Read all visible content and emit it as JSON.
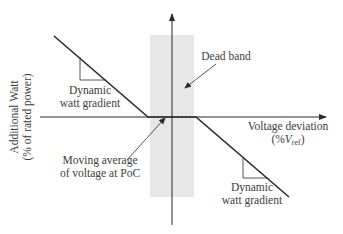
{
  "diagram": {
    "type": "droop-characteristic",
    "y_axis": {
      "line1": "Additional Watt",
      "line2": "(% of rated power)"
    },
    "x_axis": {
      "line1": "Voltage deviation",
      "line2_prefix": "(%",
      "line2_var": "V",
      "line2_sub": "ref",
      "line2_suffix": ")"
    },
    "annotations": {
      "dead_band": "Dead band",
      "moving_average_line1": "Moving average",
      "moving_average_line2": "of voltage at PoC",
      "gradient_left_line1": "Dynamic",
      "gradient_left_line2": "watt gradient",
      "gradient_right_line1": "Dynamic",
      "gradient_right_line2": "watt gradient"
    },
    "colors": {
      "line": "#2b2b2b",
      "dead_band_fill": "#e6e6e6",
      "text": "#3c3c3c"
    }
  }
}
